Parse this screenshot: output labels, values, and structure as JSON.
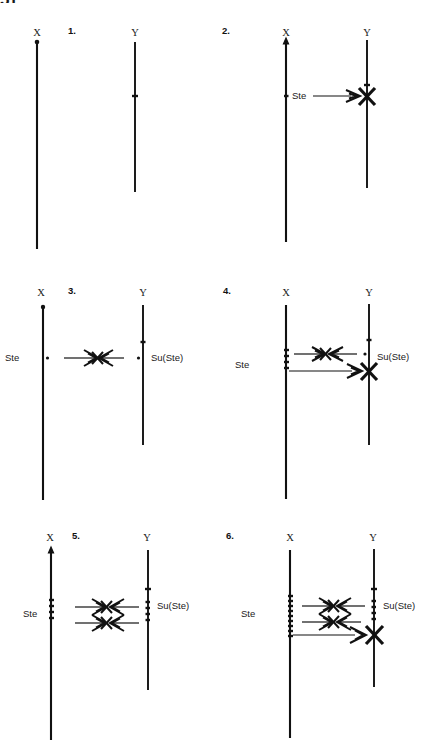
{
  "figure": {
    "corner_text": "51",
    "chromosome_labels": {
      "x": "X",
      "y": "Y"
    },
    "gene_labels": {
      "ste": "Ste",
      "suste": "Su(Ste)"
    },
    "colors": {
      "ink": "#111111",
      "background": "#ffffff"
    },
    "panels": [
      {
        "number": "1.",
        "x_label": "X",
        "y_label": "Y",
        "ste_label": "",
        "suste_label": "",
        "x_copies": 0,
        "y_copies": 1,
        "paired_arrows": 0,
        "unopposed_arrows": 0,
        "target_silenced": false
      },
      {
        "number": "2.",
        "x_label": "X",
        "y_label": "Y",
        "ste_label": "Ste",
        "suste_label": "",
        "x_copies": 1,
        "y_copies": 1,
        "paired_arrows": 0,
        "unopposed_arrows": 1,
        "target_silenced": true
      },
      {
        "number": "3.",
        "x_label": "X",
        "y_label": "Y",
        "ste_label": "Ste",
        "suste_label": "Su(Ste)",
        "x_copies": 1,
        "y_copies": 1,
        "paired_arrows": 1,
        "unopposed_arrows": 0,
        "target_silenced": false
      },
      {
        "number": "4.",
        "x_label": "X",
        "y_label": "Y",
        "ste_label": "Ste",
        "suste_label": "Su(Ste)",
        "x_copies": 4,
        "y_copies": 1,
        "paired_arrows": 1,
        "unopposed_arrows": 1,
        "target_silenced": true
      },
      {
        "number": "5.",
        "x_label": "X",
        "y_label": "Y",
        "ste_label": "Ste",
        "suste_label": "Su(Ste)",
        "x_copies": 4,
        "y_copies": 4,
        "paired_arrows": 2,
        "unopposed_arrows": 0,
        "target_silenced": false
      },
      {
        "number": "6.",
        "x_label": "X",
        "y_label": "Y",
        "ste_label": "Ste",
        "suste_label": "Su(Ste)",
        "x_copies": 9,
        "y_copies": 4,
        "paired_arrows": 2,
        "unopposed_arrows": 1,
        "target_silenced": true
      }
    ]
  }
}
